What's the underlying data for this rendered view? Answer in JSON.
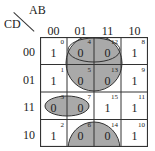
{
  "kmap": {
    "row_var": "CD",
    "col_var": "AB",
    "col_labels": [
      "00",
      "01",
      "11",
      "10"
    ],
    "row_labels": [
      "00",
      "01",
      "11",
      "10"
    ],
    "cells": [
      [
        {
          "value": "1",
          "index": "0"
        },
        {
          "value": "0",
          "index": "4"
        },
        {
          "value": "0",
          "index": "12"
        },
        {
          "value": "1",
          "index": "8"
        }
      ],
      [
        {
          "value": "1",
          "index": "1"
        },
        {
          "value": "0",
          "index": "5"
        },
        {
          "value": "0",
          "index": "13"
        },
        {
          "value": "1",
          "index": "9"
        }
      ],
      [
        {
          "value": "0",
          "index": "3"
        },
        {
          "value": "0",
          "index": "7"
        },
        {
          "value": "1",
          "index": "15"
        },
        {
          "value": "1",
          "index": "11"
        }
      ],
      [
        {
          "value": "1",
          "index": "2"
        },
        {
          "value": "0",
          "index": "6"
        },
        {
          "value": "0",
          "index": "14"
        },
        {
          "value": "1",
          "index": "10"
        }
      ]
    ],
    "groups": [
      {
        "name": "group-0145-1213",
        "cells": [
          "4",
          "5",
          "12",
          "13"
        ],
        "shape": "circle"
      },
      {
        "name": "group-4-12",
        "cells": [
          "4",
          "12"
        ],
        "shape": "ellipse"
      },
      {
        "name": "group-3-7",
        "cells": [
          "3",
          "7"
        ],
        "shape": "ellipse"
      },
      {
        "name": "group-6-14",
        "cells": [
          "6",
          "14"
        ],
        "shape": "half-circle"
      }
    ],
    "group_fill": "#a9a9a9",
    "line_color": "#333333"
  }
}
